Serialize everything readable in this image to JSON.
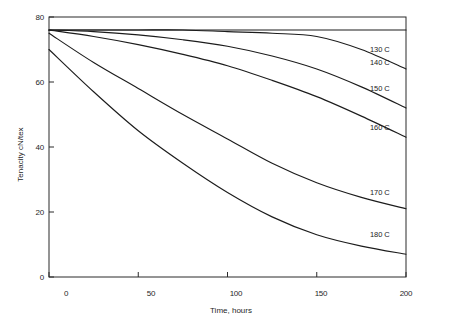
{
  "chart_data": {
    "type": "line",
    "title": "",
    "xlabel": "Time, hours",
    "ylabel": "Tenacity cN/tex",
    "xlim": [
      0,
      200
    ],
    "ylim": [
      0,
      80
    ],
    "xticks": [
      0,
      50,
      100,
      150,
      200
    ],
    "yticks": [
      0,
      20,
      40,
      60,
      80
    ],
    "xtick_labels": [
      "0",
      "50",
      "100",
      "150",
      "200"
    ],
    "ytick_labels": [
      "0",
      "20",
      "40",
      "60",
      "80"
    ],
    "grid": false,
    "legend_position": "inline-right-annotations",
    "x": [
      0,
      25,
      50,
      75,
      100,
      125,
      150,
      175,
      200
    ],
    "series": [
      {
        "name": "130 C",
        "label": "130 C",
        "values": [
          76,
          76,
          76,
          76,
          76,
          76,
          76,
          76,
          76
        ]
      },
      {
        "name": "140 C",
        "label": "140 C",
        "values": [
          76,
          76,
          76,
          76,
          75.5,
          75,
          74,
          70,
          64
        ]
      },
      {
        "name": "150 C",
        "label": "150 C",
        "values": [
          76,
          75.5,
          74.5,
          73,
          71,
          68,
          64,
          58.5,
          52
        ]
      },
      {
        "name": "160 C",
        "label": "160 C",
        "values": [
          76,
          74,
          71.5,
          68.5,
          65,
          60.5,
          55.5,
          49.5,
          43
        ]
      },
      {
        "name": "170 C",
        "label": "170 C",
        "values": [
          75,
          66,
          58,
          50,
          42.5,
          35,
          29,
          24.5,
          21
        ]
      },
      {
        "name": "180 C",
        "label": "180 C",
        "values": [
          70,
          57,
          45,
          35,
          26,
          18.5,
          13,
          9.5,
          7
        ]
      }
    ],
    "series_label_positions": [
      {
        "x": 205,
        "y": 70
      },
      {
        "x": 205,
        "y": 66
      },
      {
        "x": 205,
        "y": 58
      },
      {
        "x": 205,
        "y": 46
      },
      {
        "x": 205,
        "y": 26
      },
      {
        "x": 205,
        "y": 13
      }
    ]
  }
}
